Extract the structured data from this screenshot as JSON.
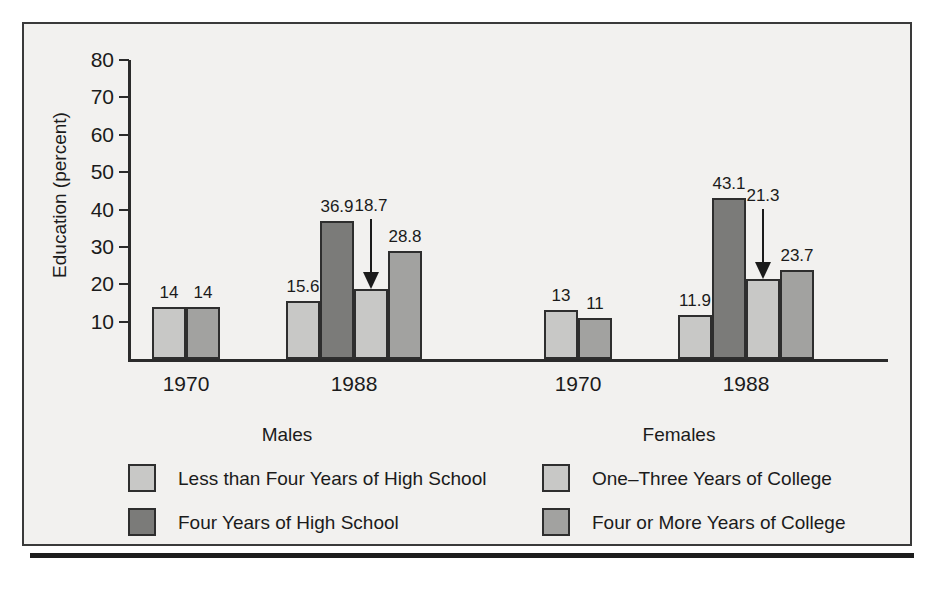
{
  "chart_data": {
    "type": "bar",
    "title": "",
    "xlabel": "",
    "ylabel": "Education (percent)",
    "ylim": [
      0,
      80
    ],
    "yticks": [
      10,
      20,
      30,
      40,
      50,
      60,
      70,
      80
    ],
    "grid": false,
    "legend_position": "bottom",
    "panels": [
      {
        "name": "Males",
        "groups": [
          {
            "category": "1970",
            "bars": [
              {
                "series": "Less than Four Years of High School",
                "value": 14,
                "label": "14",
                "annotated": false
              },
              {
                "series": "Four or More Years of College",
                "value": 14,
                "label": "14",
                "annotated": false
              }
            ]
          },
          {
            "category": "1988",
            "bars": [
              {
                "series": "Less than Four Years of High School",
                "value": 15.6,
                "label": "15.6",
                "annotated": false
              },
              {
                "series": "Four Years of High School",
                "value": 36.9,
                "label": "36.9",
                "annotated": false
              },
              {
                "series": "One–Three Years of College",
                "value": 18.7,
                "label": "18.7",
                "annotated": true
              },
              {
                "series": "Four or More Years of College",
                "value": 28.8,
                "label": "28.8",
                "annotated": false
              }
            ]
          }
        ]
      },
      {
        "name": "Females",
        "groups": [
          {
            "category": "1970",
            "bars": [
              {
                "series": "Less than Four Years of High School",
                "value": 13,
                "label": "13",
                "annotated": false
              },
              {
                "series": "Four or More Years of College",
                "value": 11,
                "label": "11",
                "annotated": false
              }
            ]
          },
          {
            "category": "1988",
            "bars": [
              {
                "series": "Less than Four Years of High School",
                "value": 11.9,
                "label": "11.9",
                "annotated": false
              },
              {
                "series": "Four Years of High School",
                "value": 43.1,
                "label": "43.1",
                "annotated": false
              },
              {
                "series": "One–Three Years of College",
                "value": 21.3,
                "label": "21.3",
                "annotated": true
              },
              {
                "series": "Four or More Years of College",
                "value": 23.7,
                "label": "23.7",
                "annotated": false
              }
            ]
          }
        ]
      }
    ],
    "legend": [
      {
        "label": "Less than Four Years of High School",
        "color": "#c8c8c6"
      },
      {
        "label": "Four Years of High School",
        "color": "#7b7b79"
      },
      {
        "label": "One–Three Years of College",
        "color": "#c8c8c6"
      },
      {
        "label": "Four or More Years of College",
        "color": "#a2a2a0"
      }
    ],
    "colors": {
      "less_than_four_hs": "#c8c8c6",
      "four_years_hs": "#7b7b79",
      "one_three_college": "#c8c8c6",
      "four_or_more_college": "#a2a2a0",
      "bar_outline": "#2e2e2e",
      "axis": "#2b2b2b",
      "background": "#f2f1ef",
      "text": "#1b1b1b"
    }
  }
}
